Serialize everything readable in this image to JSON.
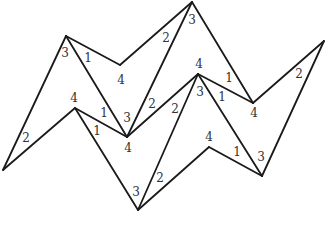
{
  "diagram": {
    "line_color": "#1a1a1a",
    "label_color": "#333333",
    "vertices": {
      "A": "left-bottom tip",
      "B": "top-left peak",
      "C": "upper valley",
      "D": "top peak",
      "E": "left middle peak",
      "F": "center valley",
      "G": "right middle peak",
      "H": "right valley",
      "I": "right tip",
      "J": "bottom valley",
      "K": "bottom-right peak",
      "L": "bottom-right valley"
    },
    "edges": [
      [
        "A",
        "B"
      ],
      [
        "B",
        "C"
      ],
      [
        "C",
        "D"
      ],
      [
        "B",
        "F"
      ],
      [
        "A",
        "E"
      ],
      [
        "E",
        "F"
      ],
      [
        "F",
        "D"
      ],
      [
        "F",
        "G"
      ],
      [
        "D",
        "H"
      ],
      [
        "G",
        "H"
      ],
      [
        "H",
        "I"
      ],
      [
        "E",
        "J"
      ],
      [
        "J",
        "G"
      ],
      [
        "J",
        "K"
      ],
      [
        "K",
        "L"
      ],
      [
        "G",
        "L"
      ],
      [
        "L",
        "I"
      ]
    ],
    "labels": [
      {
        "id": "b-3",
        "text": "3"
      },
      {
        "id": "b-1",
        "text": "1"
      },
      {
        "id": "c-4",
        "text": "4"
      },
      {
        "id": "d-2",
        "text": "2"
      },
      {
        "id": "d-3",
        "text": "3"
      },
      {
        "id": "a-2",
        "text": "2"
      },
      {
        "id": "e-4",
        "text": "4"
      },
      {
        "id": "e-1a",
        "text": "1"
      },
      {
        "id": "e-1b",
        "text": "1"
      },
      {
        "id": "f-3",
        "text": "3"
      },
      {
        "id": "f-4",
        "text": "4"
      },
      {
        "id": "f-2",
        "text": "2"
      },
      {
        "id": "g-2",
        "text": "2"
      },
      {
        "id": "g-4",
        "text": "4"
      },
      {
        "id": "g-3",
        "text": "3"
      },
      {
        "id": "g-1",
        "text": "1"
      },
      {
        "id": "h-1",
        "text": "1"
      },
      {
        "id": "h-4",
        "text": "4"
      },
      {
        "id": "i-2",
        "text": "2"
      },
      {
        "id": "j-3",
        "text": "3"
      },
      {
        "id": "j-2",
        "text": "2"
      },
      {
        "id": "k-4",
        "text": "4"
      },
      {
        "id": "l-1",
        "text": "1"
      },
      {
        "id": "l-3",
        "text": "3"
      }
    ]
  }
}
